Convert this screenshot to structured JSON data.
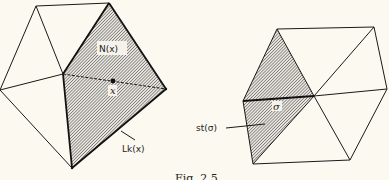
{
  "figure": {
    "caption": "Fig. 2.5",
    "left_panel": {
      "label_neighbourhood": "N(x)",
      "label_point": "x",
      "label_link": "Lk(x)"
    },
    "right_panel": {
      "label_simplex": "σ",
      "label_star": "st(σ)"
    },
    "colors": {
      "line": "#1a1a1a",
      "hatch": "#555555",
      "background": "#fbf9f0"
    }
  }
}
